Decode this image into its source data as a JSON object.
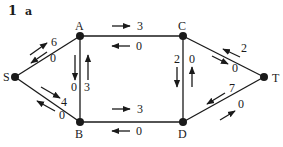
{
  "figure": {
    "number": "1",
    "part": "a"
  },
  "nodes": [
    {
      "id": "S",
      "label": "S"
    },
    {
      "id": "A",
      "label": "A"
    },
    {
      "id": "B",
      "label": "B"
    },
    {
      "id": "C",
      "label": "C"
    },
    {
      "id": "D",
      "label": "D"
    },
    {
      "id": "T",
      "label": "T"
    }
  ],
  "edges": [
    {
      "from": "S",
      "to": "A",
      "forward": "6",
      "backward": "0"
    },
    {
      "from": "S",
      "to": "B",
      "forward": "4",
      "backward": "0"
    },
    {
      "from": "A",
      "to": "C",
      "forward": "3",
      "backward": "0"
    },
    {
      "from": "B",
      "to": "D",
      "forward": "3",
      "backward": "0"
    },
    {
      "from": "A",
      "to": "B",
      "forward": "0",
      "backward": "3"
    },
    {
      "from": "C",
      "to": "D",
      "forward": "2",
      "backward": "0"
    },
    {
      "from": "C",
      "to": "T",
      "forward": "0",
      "backward": "2"
    },
    {
      "from": "D",
      "to": "T",
      "forward": "0",
      "backward": "7"
    }
  ],
  "colors": {
    "ink": "#1a1a1a",
    "background": "#ffffff"
  }
}
